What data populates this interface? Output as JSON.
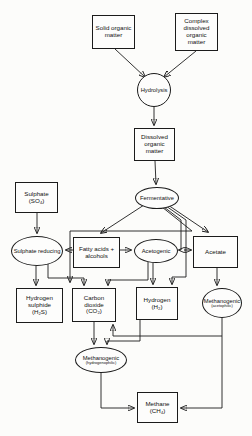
{
  "diagram": {
    "type": "flowchart",
    "line_color": "#1b1b1b",
    "background_color": "#fcfcfa"
  },
  "nodes": {
    "solid_organic": {
      "label": "Solid organic matter",
      "shape": "rect"
    },
    "complex_dissolved": {
      "label": "Complex dissolved organic matter",
      "shape": "rect"
    },
    "hydrolysis": {
      "label": "Hydrolysis",
      "shape": "circle"
    },
    "dissolved_organic": {
      "label": "Dissolved organic matter",
      "shape": "rect"
    },
    "fermentative": {
      "label": "Fermentative",
      "shape": "ellipse"
    },
    "sulphate": {
      "label": "Sulphate",
      "formula": "(SO₄)",
      "shape": "rect"
    },
    "sulphate_reducing": {
      "label": "Sulphate reducing",
      "shape": "ellipse"
    },
    "fatty_acids": {
      "label": "Fatty acids + alcohols",
      "shape": "rect"
    },
    "acetogenic": {
      "label": "Acetogenic",
      "shape": "ellipse"
    },
    "acetate": {
      "label": "Acetate",
      "shape": "rect"
    },
    "hydrogen_sulphide": {
      "label": "Hydrogen sulphide",
      "formula": "(H₂S)",
      "shape": "rect"
    },
    "carbon_dioxide": {
      "label": "Carbon dioxide",
      "formula": "(CO₂)",
      "shape": "rect"
    },
    "hydrogen": {
      "label": "Hydrogen",
      "formula": "(H₂)",
      "shape": "rect"
    },
    "methanogenic_acetophilic": {
      "label": "Methanogenic",
      "sublabel": "(acetophilic)",
      "shape": "ellipse"
    },
    "methanogenic_hydrogenophilic": {
      "label": "Methanogenic",
      "sublabel": "(hydrogenophilic)",
      "shape": "ellipse"
    },
    "methane": {
      "label": "Methane",
      "formula": "(CH₄)",
      "shape": "rect"
    }
  },
  "edges": [
    {
      "from": "solid_organic",
      "to": "hydrolysis",
      "d": "M115,49 L145,77"
    },
    {
      "from": "complex_dissolved",
      "to": "hydrolysis",
      "d": "M196,51 L164,77"
    },
    {
      "from": "hydrolysis",
      "to": "dissolved_organic",
      "d": "M154,107 L154,125"
    },
    {
      "from": "dissolved_organic",
      "to": "fermentative",
      "d": "M155,161 L156,184"
    },
    {
      "from": "sulphate",
      "to": "sulphate_reducing",
      "d": "M37,213 L37,233"
    },
    {
      "from": "fermentative",
      "to": "fatty_acids",
      "d": "M144,205 L101,233"
    },
    {
      "from": "fermentative",
      "to": "acetate",
      "d": "M168,205 L208,232"
    },
    {
      "from": "fermentative",
      "to": "carbon_dioxide",
      "d": "M162,207 L192,231 L70,231 L70,282"
    },
    {
      "from": "fermentative",
      "to": "acetogenic",
      "d": "M164,207 L181,220 L181,250 L179,250"
    },
    {
      "from": "fermentative",
      "to": "hydrogen",
      "d": "M166,206 L186,220 L186,277 L172,277 L172,284"
    },
    {
      "from": "acetogenic",
      "to": "acetate",
      "d": "M184,250 L191,250"
    },
    {
      "from": "fatty_acids",
      "to": "acetogenic",
      "d": "M120,250 L131,250"
    },
    {
      "from": "fatty_acids",
      "to": "sulphate_reducing",
      "d": "M73,250 L66,250"
    },
    {
      "from": "sulphate_reducing",
      "to": "hydrogen_sulphide",
      "d": "M36,266 L36,285"
    },
    {
      "from": "sulphate_reducing",
      "to": "carbon_dioxide",
      "d": "M48,264 L48,278 L84,278 L84,285"
    },
    {
      "from": "acetogenic",
      "to": "hydrogen",
      "d": "M153,263 L153,284"
    },
    {
      "from": "acetogenic",
      "to": "carbon_dioxide",
      "d": "M148,262 L148,280 L108,280 L108,285"
    },
    {
      "from": "acetate",
      "to": "methanogenic_acetophilic",
      "d": "M217,268 L217,285"
    },
    {
      "from": "carbon_dioxide",
      "to": "methanogenic_hydrogenophilic",
      "d": "M94,322 L94,344"
    },
    {
      "from": "hydrogen",
      "to": "methanogenic_hydrogenophilic",
      "d": "M140,320 L140,341 L107,341 L107,344"
    },
    {
      "from": "methanogenic_acetophilic",
      "to": "carbon_dioxide",
      "d": "M222,318 L222,336 L113,336 L113,325"
    },
    {
      "from": "methanogenic_acetophilic",
      "to": "methane",
      "d": "M222,336 L222,408 L181,408"
    },
    {
      "from": "methanogenic_hydrogenophilic",
      "to": "methane",
      "d": "M101,373 L101,408 L134,408"
    }
  ]
}
